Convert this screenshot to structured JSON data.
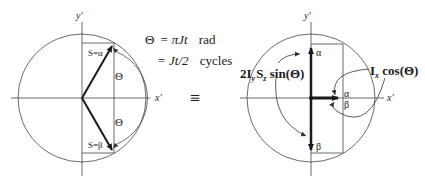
{
  "left_diagram": {
    "axis_y_label": "y'",
    "axis_x_label": "x'",
    "vector_up_label": "S=α",
    "vector_down_label": "S=β",
    "angle_top_label": "Θ",
    "angle_bottom_label": "Θ"
  },
  "equations": {
    "line1_lhs": "Θ",
    "line1_eq": "= πJt",
    "line1_unit": "rad",
    "line2_eq": "= Jt/2",
    "line2_unit": "cycles"
  },
  "equivalence_symbol": "≡",
  "right_diagram": {
    "axis_y_label": "y'",
    "axis_x_label": "x'",
    "up_label": "α",
    "down_label": "β",
    "x_alpha_label": "α",
    "x_beta_label": "β",
    "term_sin_main": "2I",
    "term_sin_sub1": "y",
    "term_sin_S": "S",
    "term_sin_sub2": "z",
    "term_sin_func": " sin(Θ)",
    "term_cos_I": "I",
    "term_cos_sub": "x",
    "term_cos_func": " cos(Θ)"
  },
  "colors": {
    "line": "#333333",
    "vector": "#1a1a1a",
    "background": "#ffffff"
  }
}
